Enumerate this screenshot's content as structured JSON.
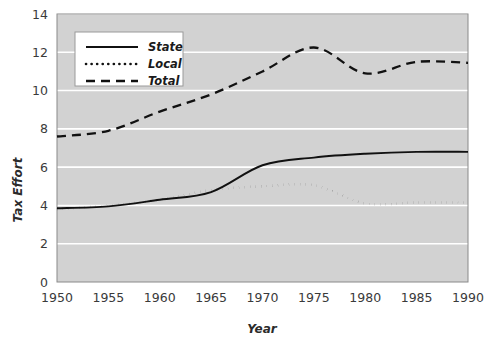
{
  "chart_data": {
    "type": "line",
    "title": "",
    "xlabel": "Year",
    "ylabel": "Tax Effort",
    "x": [
      1950,
      1955,
      1960,
      1965,
      1970,
      1975,
      1980,
      1985,
      1990
    ],
    "xtick_labels": [
      "1950",
      "1955",
      "1960",
      "1965",
      "1970",
      "1975",
      "1980",
      "1985",
      "1990"
    ],
    "ytick_labels": [
      "0",
      "2",
      "4",
      "6",
      "8",
      "10",
      "12",
      "14"
    ],
    "yticks": [
      0,
      2,
      4,
      6,
      8,
      10,
      12,
      14
    ],
    "xlim": [
      1950,
      1990
    ],
    "ylim": [
      0,
      14
    ],
    "grid": "horizontal",
    "plot_background": "#d2d2d2",
    "gridline_color": "#ffffff",
    "line_color": "#111111",
    "legend_position": "top-left",
    "series": [
      {
        "name": "State",
        "style": "solid",
        "values": [
          3.85,
          3.95,
          4.3,
          4.7,
          6.1,
          6.5,
          6.7,
          6.8,
          6.8
        ]
      },
      {
        "name": "Local",
        "style": "dotted",
        "values": [
          3.8,
          4.0,
          4.3,
          4.8,
          5.0,
          5.05,
          4.1,
          4.15,
          4.15
        ]
      },
      {
        "name": "Total",
        "style": "dashed",
        "values": [
          7.6,
          7.9,
          8.9,
          9.8,
          11.0,
          12.25,
          10.9,
          11.5,
          11.45
        ]
      }
    ]
  }
}
